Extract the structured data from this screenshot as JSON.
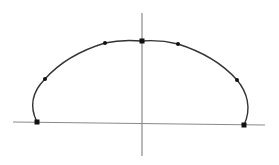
{
  "diagram": {
    "type": "curve-on-axes",
    "colors": {
      "axis": "#8a8a8a",
      "curve": "#333333",
      "point": "#111111",
      "background": "#ffffff"
    },
    "axes": {
      "horizontal": {
        "x1": 13,
        "y1": 122,
        "x2": 265,
        "y2": 125
      },
      "vertical": {
        "x1": 142,
        "y1": 13,
        "x2": 142,
        "y2": 156
      }
    },
    "curve_path": "M37,122 C28,104 34,90 45,79 C60,62 82,50 105,43 C118,40 130,40 142,41 C155,40 166,41 178,44 C200,51 222,63 237,80 C247,92 252,108 244,125",
    "points": [
      {
        "x": 37,
        "y": 122,
        "shape": "square"
      },
      {
        "x": 45,
        "y": 79,
        "shape": "dot"
      },
      {
        "x": 105,
        "y": 43,
        "shape": "dot"
      },
      {
        "x": 142,
        "y": 41,
        "shape": "square"
      },
      {
        "x": 178,
        "y": 44,
        "shape": "dot"
      },
      {
        "x": 237,
        "y": 80,
        "shape": "dot"
      },
      {
        "x": 244,
        "y": 125,
        "shape": "square"
      }
    ]
  }
}
